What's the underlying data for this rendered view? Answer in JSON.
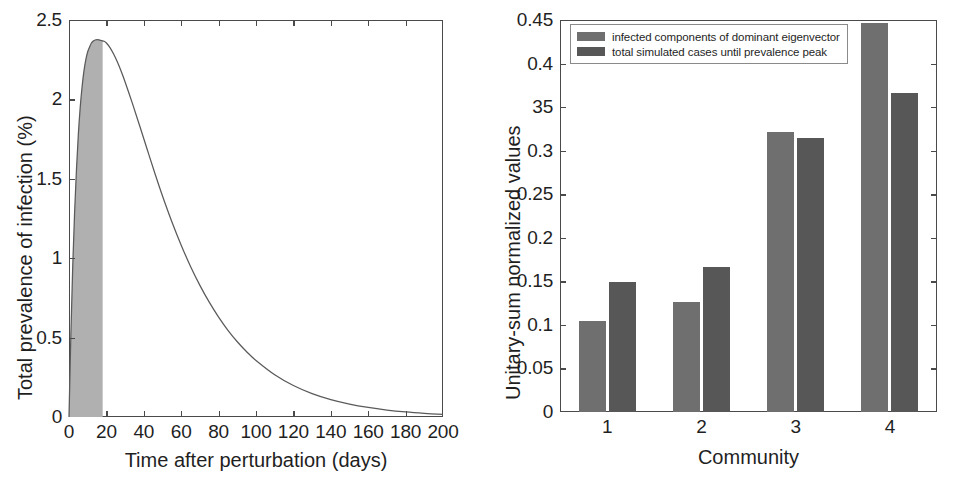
{
  "figure": {
    "panels": [
      "prevalence-curve",
      "community-bars"
    ]
  },
  "chart_data": [
    {
      "id": "left",
      "type": "area",
      "title": "",
      "xlabel": "Time after perturbation (days)",
      "ylabel": "Total prevalence of infection (%)",
      "xlim": [
        0,
        200
      ],
      "ylim": [
        0,
        2.5
      ],
      "xticks": [
        0,
        20,
        40,
        60,
        80,
        100,
        120,
        140,
        160,
        180,
        200
      ],
      "xtick_labels": [
        "0",
        "20",
        "40",
        "60",
        "80",
        "100",
        "120",
        "140",
        "160",
        "180",
        "200"
      ],
      "yticks": [
        0,
        0.5,
        1,
        1.5,
        2,
        2.5
      ],
      "ytick_labels": [
        "0",
        "0.5",
        "1",
        "1.5",
        "2",
        "2.5"
      ],
      "grid": false,
      "legend": "none",
      "line_color": "#5a5a5a",
      "fill_color": "#b0b0b0",
      "shaded_region": {
        "label": "cases until prevalence peak",
        "x_start": 0,
        "x_end": 18
      },
      "peak": {
        "x": 19,
        "y": 2.37
      },
      "x": [
        0,
        1,
        2,
        3,
        4,
        5,
        6,
        7,
        8,
        9,
        10,
        11,
        12,
        13,
        14,
        15,
        16,
        17,
        18,
        19,
        20,
        22,
        24,
        26,
        28,
        30,
        34,
        38,
        42,
        46,
        50,
        55,
        60,
        65,
        70,
        75,
        80,
        85,
        90,
        95,
        100,
        110,
        120,
        130,
        140,
        150,
        160,
        170,
        180,
        190,
        200
      ],
      "y": [
        0.0,
        0.52,
        0.95,
        1.29,
        1.56,
        1.78,
        1.95,
        2.08,
        2.18,
        2.25,
        2.3,
        2.33,
        2.355,
        2.368,
        2.374,
        2.376,
        2.375,
        2.372,
        2.368,
        2.365,
        2.355,
        2.325,
        2.283,
        2.232,
        2.174,
        2.11,
        1.972,
        1.826,
        1.678,
        1.532,
        1.392,
        1.23,
        1.082,
        0.948,
        0.829,
        0.723,
        0.629,
        0.546,
        0.474,
        0.411,
        0.356,
        0.266,
        0.198,
        0.147,
        0.109,
        0.081,
        0.06,
        0.044,
        0.032,
        0.023,
        0.016
      ]
    },
    {
      "id": "right",
      "type": "bar",
      "title": "",
      "xlabel": "Community",
      "ylabel": "Unitary-sum normalized values",
      "categories": [
        "1",
        "2",
        "3",
        "4"
      ],
      "ylim": [
        0,
        0.45
      ],
      "yticks": [
        0,
        0.05,
        0.1,
        0.15,
        0.2,
        0.25,
        0.3,
        0.35,
        0.4,
        0.45
      ],
      "ytick_labels": [
        "0",
        "0.05",
        "0.1",
        "0.15",
        "0.2",
        "0.25",
        "0.3",
        "35",
        "0.4",
        "0.45"
      ],
      "grid": false,
      "legend": "upper left",
      "series": [
        {
          "name": "infected components of dominant eigenvector",
          "color": "#6f6f6f",
          "values": [
            0.104,
            0.126,
            0.322,
            0.446
          ]
        },
        {
          "name": "total simulated cases until prevalence peak",
          "color": "#575757",
          "values": [
            0.149,
            0.167,
            0.314,
            0.366
          ]
        }
      ]
    }
  ]
}
